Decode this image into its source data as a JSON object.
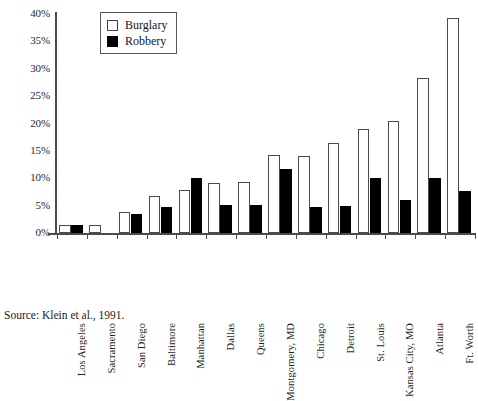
{
  "chart_data": {
    "type": "bar",
    "title": "",
    "xlabel": "",
    "ylabel": "",
    "ylim": [
      0,
      40
    ],
    "ytick_values": [
      0,
      5,
      10,
      15,
      20,
      25,
      30,
      35,
      40
    ],
    "ytick_labels": [
      "0%",
      "5%",
      "10%",
      "15%",
      "20%",
      "25%",
      "30%",
      "35%",
      "40%"
    ],
    "grid": false,
    "legend_position": "top-left-inside",
    "categories": [
      "Los Angeles",
      "Sacramento",
      "San Diego",
      "Baltimore",
      "Manhattan",
      "Dallas",
      "Queens",
      "Montgomery, MD",
      "Chicago",
      "Detroit",
      "St. Louis",
      "Kansas City, MO",
      "Atlanta",
      "Ft. Worth"
    ],
    "series": [
      {
        "name": "Burglary",
        "color": "#ffffff",
        "edge_color": "#4a4a52",
        "values": [
          1.5,
          1.5,
          3.8,
          6.8,
          7.9,
          9.1,
          9.4,
          14.2,
          14.0,
          16.5,
          19.0,
          20.5,
          28.4,
          39.3
        ]
      },
      {
        "name": "Robbery",
        "color": "#000000",
        "edge_color": "#000000",
        "values": [
          1.5,
          0.0,
          3.5,
          4.7,
          10.0,
          5.2,
          5.2,
          11.7,
          4.7,
          5.0,
          10.0,
          6.1,
          10.0,
          7.6
        ]
      }
    ]
  },
  "legend": {
    "items": [
      {
        "label": "Burglary",
        "swatch": "burglary"
      },
      {
        "label": "Robbery",
        "swatch": "robbery"
      }
    ]
  },
  "source": {
    "text": "Source: Klein et al., 1991."
  }
}
